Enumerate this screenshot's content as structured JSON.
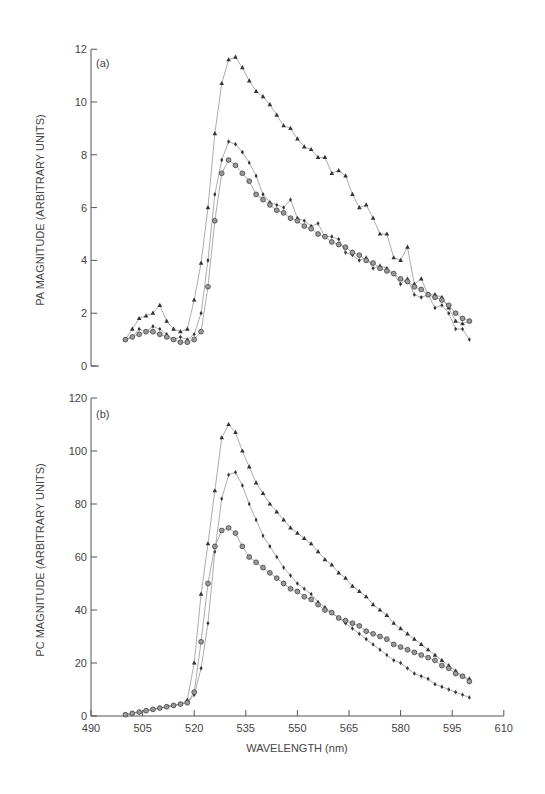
{
  "chart_data": [
    {
      "type": "line",
      "panel_label": "(a)",
      "title": "",
      "xlabel": "",
      "ylabel": "PA MAGNITUDE (ARBITRARY UNITS)",
      "ylim": [
        0,
        12
      ],
      "yticks": [
        0,
        2,
        4,
        6,
        8,
        10,
        12
      ],
      "xlim": [
        500,
        600
      ],
      "grid": false,
      "legend": "none",
      "x": [
        500,
        502,
        504,
        506,
        508,
        510,
        512,
        514,
        516,
        518,
        520,
        522,
        524,
        526,
        528,
        530,
        532,
        534,
        536,
        538,
        540,
        542,
        544,
        546,
        548,
        550,
        552,
        554,
        556,
        558,
        560,
        562,
        564,
        566,
        568,
        570,
        572,
        574,
        576,
        578,
        580,
        582,
        584,
        586,
        588,
        590,
        592,
        594,
        596,
        598,
        600
      ],
      "series": [
        {
          "name": "triangles",
          "marker": "triangle",
          "values": [
            1.0,
            1.4,
            1.8,
            1.9,
            2.0,
            2.3,
            1.7,
            1.4,
            1.3,
            1.4,
            2.5,
            3.9,
            6.0,
            8.8,
            10.7,
            11.6,
            11.7,
            11.3,
            10.8,
            10.4,
            10.2,
            9.9,
            9.5,
            9.1,
            9.0,
            8.6,
            8.3,
            8.2,
            7.9,
            7.9,
            7.3,
            7.4,
            7.2,
            6.5,
            6.0,
            6.1,
            5.6,
            5.0,
            5.0,
            4.1,
            4.0,
            4.5,
            3.1,
            3.3,
            2.7,
            2.7,
            2.6,
            2.2,
            1.7,
            1.6,
            1.7
          ]
        },
        {
          "name": "plus",
          "marker": "plus",
          "values": [
            1.0,
            1.1,
            1.4,
            1.3,
            1.5,
            1.4,
            1.2,
            1.0,
            1.1,
            1.0,
            1.2,
            2.0,
            4.0,
            6.5,
            7.8,
            8.5,
            8.4,
            8.1,
            7.7,
            7.2,
            6.5,
            6.2,
            6.1,
            6.0,
            6.3,
            5.6,
            5.5,
            5.3,
            5.4,
            4.9,
            4.9,
            4.8,
            4.3,
            4.2,
            4.0,
            4.1,
            3.7,
            3.8,
            3.7,
            3.5,
            3.1,
            3.3,
            2.7,
            2.6,
            2.7,
            2.2,
            2.3,
            2.0,
            1.4,
            1.4,
            1.0
          ]
        },
        {
          "name": "circles",
          "marker": "circle",
          "values": [
            1.0,
            1.1,
            1.2,
            1.3,
            1.3,
            1.2,
            1.1,
            1.0,
            0.9,
            0.9,
            1.0,
            1.3,
            3.0,
            5.5,
            7.3,
            7.8,
            7.6,
            7.3,
            7.0,
            6.5,
            6.3,
            6.1,
            5.9,
            5.8,
            5.6,
            5.5,
            5.3,
            5.2,
            5.0,
            4.9,
            4.7,
            4.6,
            4.5,
            4.3,
            4.2,
            4.0,
            3.9,
            3.7,
            3.6,
            3.5,
            3.3,
            3.2,
            3.0,
            2.9,
            2.7,
            2.6,
            2.5,
            2.3,
            2.0,
            1.8,
            1.7
          ]
        }
      ]
    },
    {
      "type": "line",
      "panel_label": "(b)",
      "title": "",
      "xlabel": "WAVELENGTH (nm)",
      "ylabel": "PC MAGNITUDE (ARBITRARY UNITS)",
      "ylim": [
        0,
        120
      ],
      "yticks": [
        0,
        20,
        40,
        60,
        80,
        100,
        120
      ],
      "xlim": [
        490,
        610
      ],
      "xticks": [
        490,
        505,
        520,
        535,
        550,
        565,
        580,
        595,
        610
      ],
      "grid": false,
      "legend": "none",
      "x": [
        500,
        502,
        504,
        506,
        508,
        510,
        512,
        514,
        516,
        518,
        520,
        522,
        524,
        526,
        528,
        530,
        532,
        534,
        536,
        538,
        540,
        542,
        544,
        546,
        548,
        550,
        552,
        554,
        556,
        558,
        560,
        562,
        564,
        566,
        568,
        570,
        572,
        574,
        576,
        578,
        580,
        582,
        584,
        586,
        588,
        590,
        592,
        594,
        596,
        598,
        600
      ],
      "series": [
        {
          "name": "triangles",
          "marker": "triangle",
          "values": [
            0.5,
            1,
            1.5,
            2,
            2.5,
            3,
            3.5,
            4,
            4.5,
            6,
            20,
            46,
            65,
            85,
            105,
            110,
            107,
            100,
            94,
            88,
            84,
            80,
            77,
            74,
            71,
            69,
            67,
            65,
            62,
            59,
            57,
            54,
            52,
            49,
            47,
            45,
            42,
            40,
            38,
            35,
            33,
            31,
            29,
            27,
            25,
            23,
            21,
            19,
            17,
            15,
            14
          ]
        },
        {
          "name": "plus",
          "marker": "plus",
          "values": [
            0.5,
            1,
            1.5,
            2,
            2.5,
            3,
            3.5,
            4,
            4.5,
            5,
            8,
            18,
            35,
            62,
            82,
            91,
            92,
            87,
            80,
            74,
            68,
            64,
            60,
            56,
            53,
            50,
            48,
            46,
            43,
            41,
            39,
            37,
            35,
            33,
            31,
            29,
            27,
            25,
            23,
            21,
            20,
            18,
            16,
            15,
            14,
            12,
            11,
            10,
            9,
            8,
            7
          ]
        },
        {
          "name": "circles",
          "marker": "circle",
          "values": [
            0.5,
            1,
            1.5,
            2,
            2.5,
            3,
            3.5,
            4,
            4.5,
            5,
            9,
            28,
            50,
            64,
            70,
            71,
            69,
            64,
            60,
            58,
            56,
            54,
            52,
            50,
            48,
            47,
            45,
            44,
            42,
            40,
            39,
            37,
            36,
            35,
            34,
            32,
            31,
            30,
            29,
            27,
            26,
            25,
            24,
            23,
            22,
            21,
            19,
            18,
            16,
            15,
            13
          ]
        }
      ]
    }
  ],
  "figure": {
    "panel_a_label": "(a)",
    "panel_b_label": "(b)",
    "ylabel_a": "PA MAGNITUDE (ARBITRARY UNITS)",
    "ylabel_b": "PC MAGNITUDE (ARBITRARY UNITS)",
    "xlabel": "WAVELENGTH (nm)"
  }
}
